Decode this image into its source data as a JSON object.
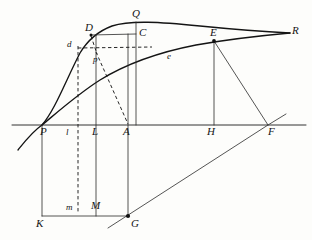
{
  "figure": {
    "background_color": "#fdfdfb",
    "ink_color": "#141414",
    "width": 312,
    "height": 240,
    "baseline_y": 125,
    "labels": [
      {
        "id": "Q",
        "text": "Q",
        "kind": "capital",
        "x": 132,
        "y": 8,
        "point_x": 136,
        "point_y": 25
      },
      {
        "id": "D",
        "text": "D",
        "kind": "capital",
        "x": 85,
        "y": 22,
        "point_x": 91,
        "point_y": 35
      },
      {
        "id": "C",
        "text": "C",
        "kind": "capital",
        "x": 139,
        "y": 27,
        "point_x": 136,
        "point_y": 34
      },
      {
        "id": "E",
        "text": "E",
        "kind": "capital",
        "x": 210,
        "y": 27,
        "point_x": 214,
        "point_y": 41
      },
      {
        "id": "R",
        "text": "R",
        "kind": "capital",
        "x": 292,
        "y": 25,
        "point_x": 288,
        "point_y": 33
      },
      {
        "id": "d",
        "text": "d",
        "kind": "lower",
        "x": 67,
        "y": 40,
        "point_x": 78,
        "point_y": 48
      },
      {
        "id": "p",
        "text": "p",
        "kind": "lower",
        "x": 93,
        "y": 55,
        "point_x": 96,
        "point_y": 52
      },
      {
        "id": "e",
        "text": "e",
        "kind": "lower",
        "x": 167,
        "y": 52,
        "point_x": 171,
        "point_y": 58
      },
      {
        "id": "P",
        "text": "P",
        "kind": "capital",
        "x": 40,
        "y": 126,
        "point_x": 42,
        "point_y": 125
      },
      {
        "id": "l",
        "text": "l",
        "kind": "lower",
        "x": 66,
        "y": 128,
        "point_x": 78,
        "point_y": 125
      },
      {
        "id": "L",
        "text": "L",
        "kind": "capital",
        "x": 92,
        "y": 126,
        "point_x": 96,
        "point_y": 125
      },
      {
        "id": "A",
        "text": "A",
        "kind": "capital",
        "x": 123,
        "y": 126,
        "point_x": 128,
        "point_y": 125
      },
      {
        "id": "H",
        "text": "H",
        "kind": "capital",
        "x": 207,
        "y": 126,
        "point_x": 214,
        "point_y": 125
      },
      {
        "id": "F",
        "text": "F",
        "kind": "capital",
        "x": 268,
        "y": 126,
        "point_x": 268,
        "point_y": 125
      },
      {
        "id": "m",
        "text": "m",
        "kind": "lower",
        "x": 66,
        "y": 203,
        "point_x": 78,
        "point_y": 211
      },
      {
        "id": "M",
        "text": "M",
        "kind": "capital",
        "x": 91,
        "y": 200,
        "point_x": 96,
        "point_y": 211
      },
      {
        "id": "K",
        "text": "K",
        "kind": "capital",
        "x": 36,
        "y": 218,
        "point_x": 42,
        "point_y": 216
      },
      {
        "id": "G",
        "text": "G",
        "kind": "capital",
        "x": 131,
        "y": 218,
        "point_x": 128,
        "point_y": 216
      }
    ],
    "points": [
      {
        "id": "P",
        "x": 42,
        "y": 125
      },
      {
        "id": "L",
        "x": 96,
        "y": 125
      },
      {
        "id": "A",
        "x": 128,
        "y": 125
      },
      {
        "id": "H",
        "x": 214,
        "y": 125
      },
      {
        "id": "F",
        "x": 268,
        "y": 125
      },
      {
        "id": "D",
        "x": 91,
        "y": 35
      },
      {
        "id": "C",
        "x": 136,
        "y": 34
      },
      {
        "id": "Q",
        "x": 136,
        "y": 25
      },
      {
        "id": "E",
        "x": 214,
        "y": 41
      },
      {
        "id": "R",
        "x": 290,
        "y": 33
      },
      {
        "id": "K",
        "x": 42,
        "y": 216
      },
      {
        "id": "M",
        "x": 96,
        "y": 216
      },
      {
        "id": "G",
        "x": 128,
        "y": 216
      },
      {
        "id": "d",
        "x": 78,
        "y": 48
      },
      {
        "id": "p",
        "x": 96,
        "y": 50
      },
      {
        "id": "e",
        "x": 171,
        "y": 58
      }
    ],
    "marked_dots": [
      {
        "id": "dot-E",
        "x": 214,
        "y": 41
      },
      {
        "id": "dot-G",
        "x": 128,
        "y": 216
      },
      {
        "id": "dot-D",
        "x": 91,
        "y": 35
      }
    ],
    "paths": {
      "upper_curve": "M 18,150 C 26,140 32,132 42,125 C 55,110 66,80 80,53 C 86,43 96,32 112,26 C 130,20 160,22 200,26 C 240,30 270,32 290,33",
      "lower_curve": "M 42,125 C 60,110 78,94 100,80 C 126,64 160,52 196,45 C 230,39 268,35 290,33",
      "baseline": "M 12,125 L 306,125",
      "vertical_L": "M 96,35 L 96,216",
      "vertical_A": "M 128,34 L 128,216",
      "vertical_C_Q": "M 136,22 L 136,125",
      "vertical_E_H": "M 214,41 L 214,125",
      "vertical_P_K": "M 42,125 L 42,216",
      "bottom_K_G": "M 42,216 L 128,216",
      "segment_D_C": "M 91,35 L 136,34",
      "segment_E_F": "M 214,41 L 268,125",
      "segment_G_F_ext": "M 108,228 L 268,125 L 284,115",
      "dashed_vertical_dm": "M 78,46 L 78,214",
      "dashed_horizontal_d": "M 78,48 L 152,47",
      "dashed_D_to_p": "M 91,36 L 97,53",
      "dashed_p_to_A": "M 96,52 L 128,124"
    }
  }
}
